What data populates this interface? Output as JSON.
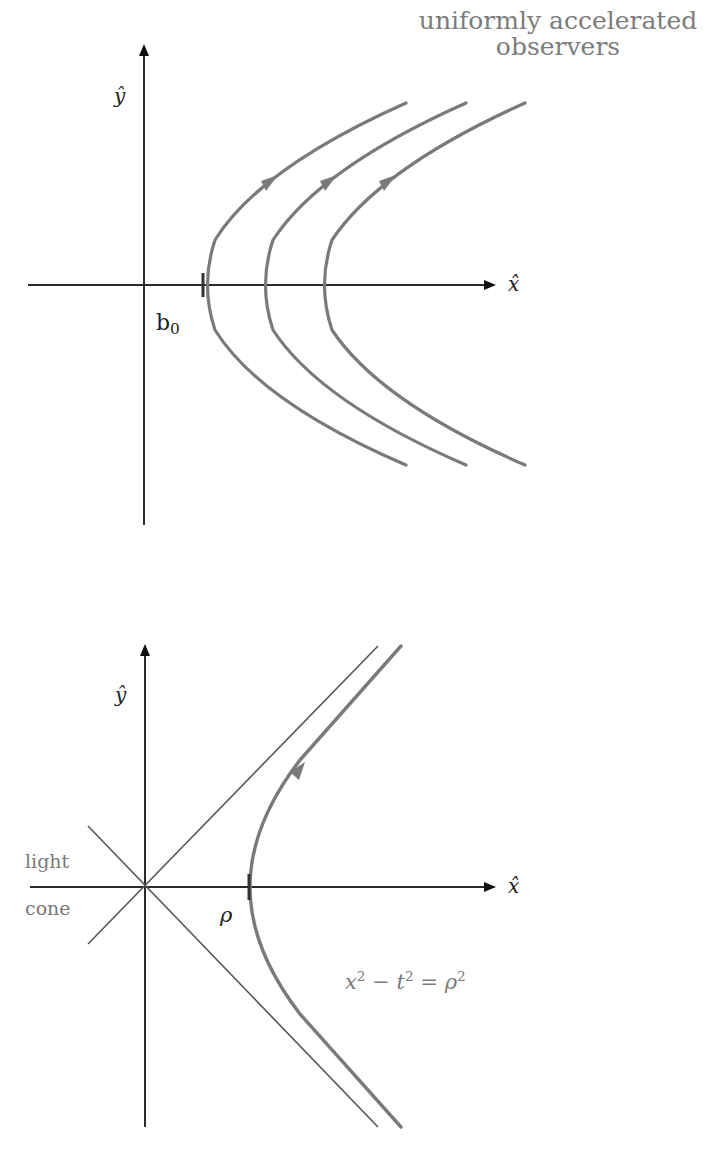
{
  "top_diagram": {
    "title_line1": "uniformly accelerated",
    "title_line2": "observers",
    "y_axis_label": "ŷ",
    "x_axis_label": "x̂",
    "vertex_label_base": "b",
    "vertex_label_sub": "0",
    "observer_count": 3,
    "curve_color": "#7a7a7a",
    "axis_color": "#1a1a1a"
  },
  "bottom_diagram": {
    "y_axis_label": "ŷ",
    "x_axis_label": "x̂",
    "light_cone_label_line1": "light",
    "light_cone_label_line2": "cone",
    "vertex_label": "ρ",
    "equation": {
      "x": "x",
      "x_exp": "2",
      "minus": "−",
      "t": "t",
      "t_exp": "2",
      "equals": "=",
      "rho": "ρ",
      "rho_exp": "2"
    },
    "curve_color": "#7a7a7a",
    "light_cone_color": "#555555",
    "axis_color": "#1a1a1a"
  }
}
